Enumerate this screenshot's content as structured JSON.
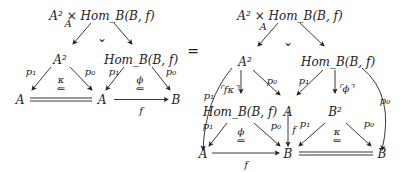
{
  "diagram": {
    "equals": "=",
    "left": {
      "apex": "A² × Hom_B(B, f)",
      "apex_sub": "A",
      "pullback_mark": "⌄",
      "nodes": {
        "A2": "A²",
        "hom": "Hom_B(B, f)",
        "A_left": "A",
        "A_mid": "A",
        "B": "B"
      },
      "labels": {
        "p1a": "p₁",
        "p0a": "p₀",
        "p1b": "p₁",
        "p0b": "p₀",
        "kappa": "κ",
        "phi": "ϕ",
        "f": "f",
        "arrow": "⇐"
      }
    },
    "right": {
      "apex": "A² × Hom_B(B, f)",
      "apex_sub": "A",
      "pullback_mark": "⌄",
      "nodes": {
        "A2": "A²",
        "hom_top": "Hom_B(B, f)",
        "hom_mid": "Hom_B(B, f)",
        "A": "A",
        "B2": "B²",
        "A_bot": "A",
        "B_mid": "B",
        "B_right": "B"
      },
      "labels": {
        "p1_outer": "p₁",
        "p0_outer": "p₀",
        "fkappa": "⌜fκ⌝",
        "p0_a": "p₀",
        "p1_b": "p₁",
        "phi_bracket": "⌜ϕ⌝",
        "p1_c": "p₁",
        "p0_c": "p₀",
        "phi": "ϕ",
        "f_vert": "f",
        "p1_d": "p₁",
        "p0_d": "p₀",
        "kappa": "κ",
        "f": "f",
        "arrow": "⇐"
      }
    }
  }
}
